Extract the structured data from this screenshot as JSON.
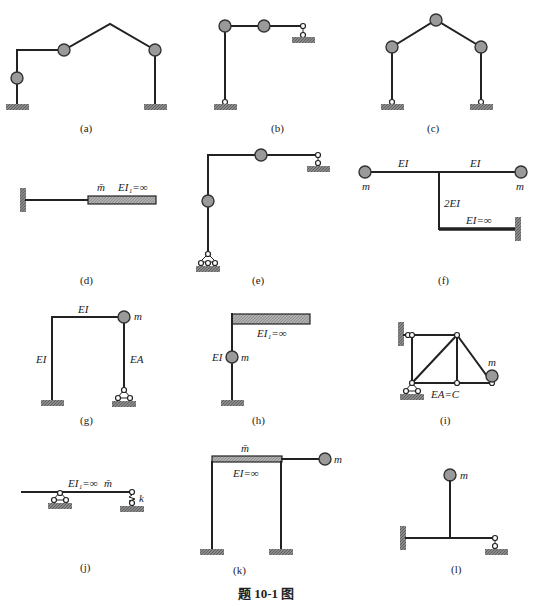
{
  "figure_title": "题 10-1 图",
  "panels": [
    {
      "id": "a",
      "caption": "(a)",
      "labels": []
    },
    {
      "id": "b",
      "caption": "(b)",
      "labels": []
    },
    {
      "id": "c",
      "caption": "(c)",
      "labels": []
    },
    {
      "id": "d",
      "caption": "(d)",
      "labels": [
        "m̄",
        "EI₁=∞"
      ]
    },
    {
      "id": "e",
      "caption": "(e)",
      "labels": []
    },
    {
      "id": "f",
      "caption": "(f)",
      "labels": [
        "EI",
        "EI",
        "m",
        "m",
        "2EI",
        "EI=∞"
      ]
    },
    {
      "id": "g",
      "caption": "(g)",
      "labels": [
        "EI",
        "m",
        "EI",
        "EA"
      ]
    },
    {
      "id": "h",
      "caption": "(h)",
      "labels": [
        "EI₁=∞",
        "EI",
        "m"
      ]
    },
    {
      "id": "i",
      "caption": "(i)",
      "labels": [
        "m",
        "EA=C"
      ]
    },
    {
      "id": "j",
      "caption": "(j)",
      "labels": [
        "EI₁=∞",
        "m̄",
        "k"
      ]
    },
    {
      "id": "k",
      "caption": "(k)",
      "labels": [
        "m̄",
        "EI=∞",
        "m"
      ]
    },
    {
      "id": "l",
      "caption": "(l)",
      "labels": [
        "m"
      ]
    }
  ]
}
